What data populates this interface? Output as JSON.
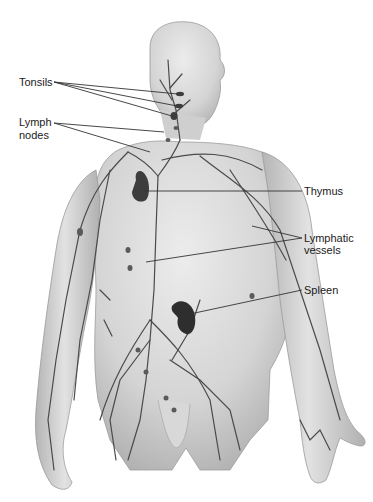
{
  "diagram": {
    "labels": {
      "tonsils": "Tonsils",
      "lymph_nodes_line1": "Lymph",
      "lymph_nodes_line2": "nodes",
      "thymus": "Thymus",
      "lymphatic_vessels_line1": "Lymphatic",
      "lymphatic_vessels_line2": "vessels",
      "spleen": "Spleen"
    },
    "colors": {
      "background": "#ffffff",
      "skin_light": "#e4e4e4",
      "skin_mid": "#c9c9c9",
      "skin_shadow": "#a8a8a8",
      "vessel": "#4a4a4a",
      "organ": "#3a3a3a",
      "leader_line": "#333333",
      "text": "#1a1a1a"
    }
  }
}
